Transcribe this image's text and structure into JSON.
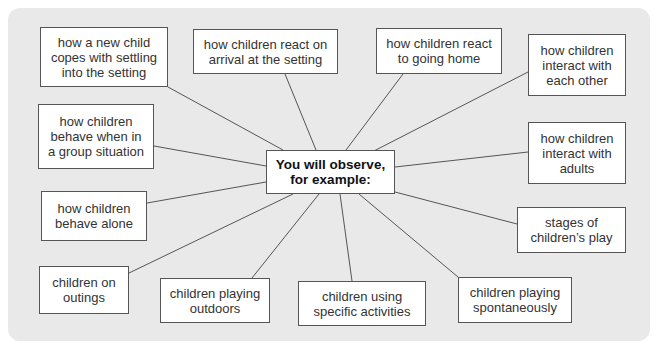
{
  "diagram": {
    "type": "spider-diagram",
    "background_color": "#e9e9e9",
    "box_border_color": "#555555",
    "center": {
      "label": "You will observe,\nfor example:",
      "box": [
        266,
        150,
        96,
        44
      ]
    },
    "nodes": [
      {
        "id": "new-child",
        "label": "how a new child\ncopes with settling\ninto the setting",
        "box": [
          40,
          27,
          128,
          60
        ],
        "anchor": [
          168,
          87
        ]
      },
      {
        "id": "react-arrival",
        "label": "how children react on\narrival at the setting",
        "box": [
          193,
          29,
          145,
          45
        ],
        "anchor": [
          285,
          74
        ]
      },
      {
        "id": "react-home",
        "label": "how children react\nto going home",
        "box": [
          376,
          28,
          126,
          46
        ],
        "anchor": [
          403,
          74
        ]
      },
      {
        "id": "interact-each-other",
        "label": "how children\ninteract with\neach other",
        "box": [
          528,
          34,
          98,
          62
        ],
        "anchor": [
          528,
          72
        ]
      },
      {
        "id": "group-situation",
        "label": "how children\nbehave when in\na group situation",
        "box": [
          38,
          104,
          116,
          65
        ],
        "anchor": [
          154,
          146
        ]
      },
      {
        "id": "interact-adults",
        "label": "how children\ninteract with\nadults",
        "box": [
          528,
          122,
          98,
          62
        ],
        "anchor": [
          528,
          152
        ]
      },
      {
        "id": "behave-alone",
        "label": "how children\nbehave alone",
        "box": [
          41,
          191,
          106,
          50
        ],
        "anchor": [
          147,
          203
        ]
      },
      {
        "id": "stages-play",
        "label": "stages of\nchildren’s play",
        "box": [
          517,
          207,
          109,
          46
        ],
        "anchor": [
          517,
          224
        ]
      },
      {
        "id": "outings",
        "label": "children on\noutings",
        "box": [
          39,
          266,
          90,
          48
        ],
        "anchor": [
          129,
          273
        ]
      },
      {
        "id": "playing-outdoors",
        "label": "children playing\noutdoors",
        "box": [
          160,
          278,
          110,
          45
        ],
        "anchor": [
          252,
          278
        ]
      },
      {
        "id": "specific-activities",
        "label": "children using\nspecific activities",
        "box": [
          298,
          281,
          128,
          45
        ],
        "anchor": [
          352,
          281
        ]
      },
      {
        "id": "spontaneously",
        "label": "children playing\nspontaneously",
        "box": [
          458,
          277,
          114,
          46
        ],
        "anchor": [
          458,
          277
        ]
      }
    ]
  }
}
